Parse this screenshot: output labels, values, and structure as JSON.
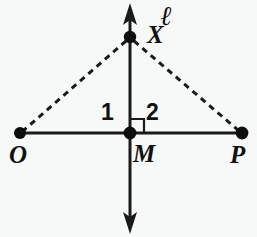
{
  "figure": {
    "type": "geometry-diagram",
    "background_color": "#f7f8f8",
    "stroke_color": "#1a1a1a"
  },
  "labels": {
    "line_l": "ℓ",
    "point_x": "X",
    "point_o": "O",
    "point_m": "M",
    "point_p": "P",
    "angle_1": "1",
    "angle_2": "2"
  },
  "geometry": {
    "points": [
      {
        "name": "X",
        "x": 130,
        "y": 37
      },
      {
        "name": "O",
        "x": 20,
        "y": 133
      },
      {
        "name": "M",
        "x": 130,
        "y": 133
      },
      {
        "name": "P",
        "x": 242,
        "y": 133
      }
    ],
    "solid_segments": [
      {
        "name": "segment-OP",
        "x1": 20,
        "y1": 133,
        "x2": 242,
        "y2": 133
      }
    ],
    "arrow_lines": [
      {
        "name": "line-l",
        "x1": 130,
        "y1": 5,
        "x2": 130,
        "y2": 232
      }
    ],
    "dashed_segments": [
      {
        "name": "segment-XO",
        "x1": 130,
        "y1": 37,
        "x2": 20,
        "y2": 133
      },
      {
        "name": "segment-XP",
        "x1": 130,
        "y1": 37,
        "x2": 242,
        "y2": 133
      }
    ],
    "right_angle_marker": {
      "name": "right-angle-at-M",
      "x": 130,
      "y": 133,
      "size": 14,
      "side": "upper-right"
    }
  }
}
